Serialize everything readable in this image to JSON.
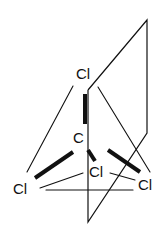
{
  "diagram": {
    "atoms": {
      "top_cl": "Cl",
      "carbon": "C",
      "left_cl": "Cl",
      "center_cl": "Cl",
      "right_cl": "Cl"
    },
    "colors": {
      "ink": "#111111",
      "background": "#ffffff"
    }
  }
}
